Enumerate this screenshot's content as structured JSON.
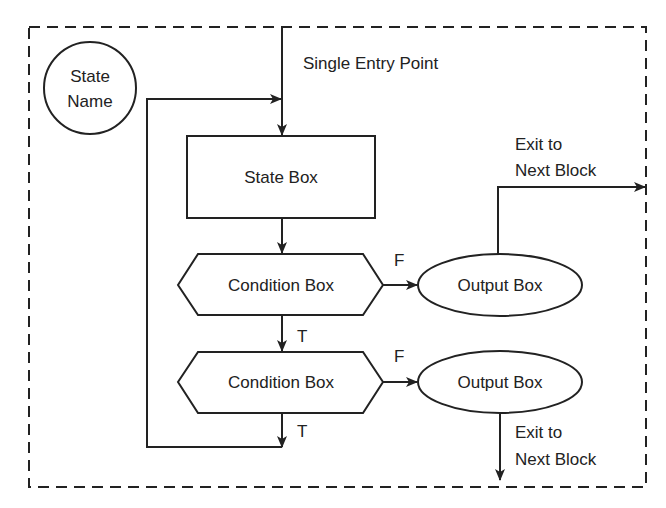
{
  "diagram": {
    "type": "ASM block (algorithmic state machine)",
    "colors": {
      "line": "#222222",
      "background": "#ffffff"
    },
    "state": {
      "line1": "State",
      "line2": "Name"
    },
    "entry_label": "Single Entry Point",
    "state_box": {
      "label": "State Box"
    },
    "conditions": [
      {
        "label": "Condition Box",
        "true_label": "T",
        "false_label": "F"
      },
      {
        "label": "Condition Box",
        "true_label": "T",
        "false_label": "F"
      }
    ],
    "outputs": [
      {
        "label": "Output Box",
        "exit_line1": "Exit to",
        "exit_line2": "Next Block"
      },
      {
        "label": "Output Box",
        "exit_line1": "Exit to",
        "exit_line2": "Next Block"
      }
    ]
  }
}
